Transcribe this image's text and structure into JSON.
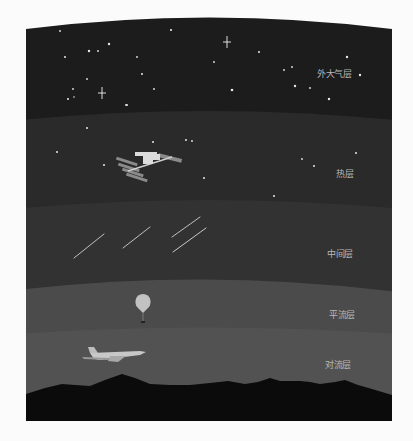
{
  "diagram": {
    "type": "atmosphere-layers",
    "colors": {
      "exosphere": "#1c1c1c",
      "thermosphere": "#2b2b2b",
      "mesosphere": "#333333",
      "stratosphere": "#4a4a4a",
      "troposphere": "#555555",
      "ground": "#0a0a0a",
      "label": "#b8b8b8",
      "page_background": "#fbfbfb"
    },
    "layers": [
      {
        "id": "exosphere",
        "label": "外大气层",
        "object": "stars"
      },
      {
        "id": "thermosphere",
        "label": "热层",
        "object": "space-station"
      },
      {
        "id": "mesosphere",
        "label": "中间层",
        "object": "meteors"
      },
      {
        "id": "stratosphere",
        "label": "平流层",
        "object": "weather-balloon"
      },
      {
        "id": "troposphere",
        "label": "对流层",
        "object": "airplane"
      }
    ]
  }
}
